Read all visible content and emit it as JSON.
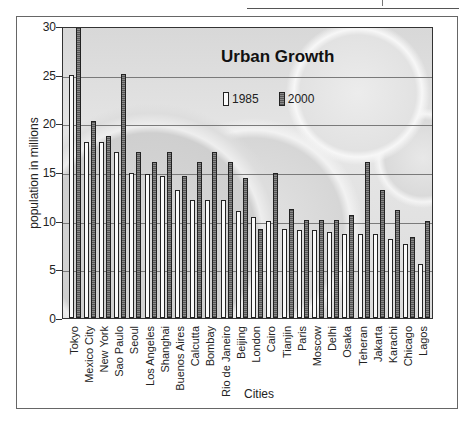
{
  "chart_data": {
    "type": "bar",
    "title": "Urban Growth",
    "xlabel": "Cities",
    "ylabel": "population in millions",
    "ylim": [
      0,
      30
    ],
    "yticks": [
      0,
      5,
      10,
      15,
      20,
      25,
      30
    ],
    "grid": true,
    "legend_position": "inside-top-center",
    "categories": [
      "Tokyo",
      "Mexico City",
      "New York",
      "Sao Paulo",
      "Seoul",
      "Los Angeles",
      "Shanghai",
      "Buenos Aires",
      "Calcutta",
      "Bombay",
      "Rio de Janeiro",
      "Beijing",
      "London",
      "Cairo",
      "Tianjin",
      "Paris",
      "Moscow",
      "Delhi",
      "Osaka",
      "Teheran",
      "Jakarta",
      "Karachi",
      "Chicago",
      "Lagos"
    ],
    "series": [
      {
        "name": "1985",
        "color": "#fafafa",
        "values": [
          25.0,
          18.1,
          18.1,
          17.1,
          14.9,
          14.8,
          14.6,
          13.2,
          12.1,
          12.1,
          12.1,
          11.0,
          10.4,
          10.0,
          9.1,
          9.0,
          9.0,
          8.8,
          8.6,
          8.6,
          8.6,
          8.1,
          7.6,
          5.5
        ]
      },
      {
        "name": "2000",
        "color": "#6e6e6e",
        "values": [
          30.0,
          20.2,
          18.7,
          25.1,
          17.1,
          16.0,
          17.1,
          14.6,
          16.0,
          17.1,
          16.0,
          14.4,
          9.1,
          14.9,
          11.2,
          10.1,
          10.1,
          10.1,
          10.6,
          16.0,
          13.2,
          11.1,
          8.3,
          10.0
        ]
      }
    ]
  },
  "legend": {
    "item_1985": "1985",
    "item_2000": "2000"
  },
  "axis": {
    "y_tick_labels": [
      "0",
      "5",
      "10",
      "15",
      "20",
      "25",
      "30"
    ]
  }
}
